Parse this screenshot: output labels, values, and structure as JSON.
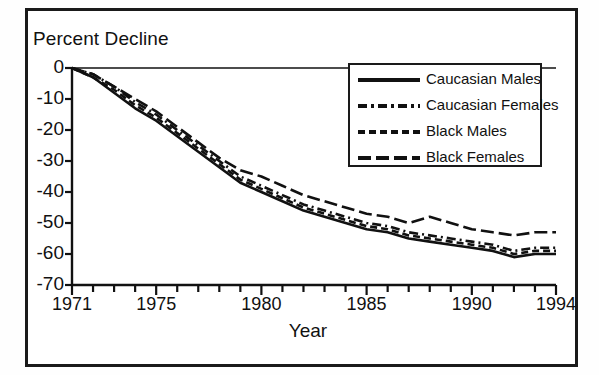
{
  "figure": {
    "y_axis_title": "Percent Decline",
    "x_axis_title": "Year"
  },
  "chart_data": {
    "type": "line",
    "title": "",
    "xlabel": "Year",
    "ylabel": "Percent Decline",
    "xlim": [
      1971,
      1994
    ],
    "ylim": [
      -70,
      0
    ],
    "grid": false,
    "legend_position": "top-right",
    "x_tick_labels": [
      "1971",
      "1975",
      "1980",
      "1985",
      "1990",
      "1994"
    ],
    "x_tick_values": [
      1971,
      1975,
      1980,
      1985,
      1990,
      1994
    ],
    "y_tick_labels": [
      "0",
      "-10",
      "-20",
      "-30",
      "-40",
      "-50",
      "-60",
      "-70"
    ],
    "y_tick_values": [
      0,
      -10,
      -20,
      -30,
      -40,
      -50,
      -60,
      -70
    ],
    "x": [
      1971,
      1972,
      1973,
      1974,
      1975,
      1976,
      1977,
      1978,
      1979,
      1980,
      1981,
      1982,
      1983,
      1984,
      1985,
      1986,
      1987,
      1988,
      1989,
      1990,
      1991,
      1992,
      1993,
      1994
    ],
    "series": [
      {
        "name": "Caucasian Males",
        "style": "solid",
        "color": "#111111",
        "values": [
          0,
          -3,
          -8,
          -13,
          -17,
          -22,
          -27,
          -32,
          -37,
          -40,
          -43,
          -46,
          -48,
          -50,
          -52,
          -53,
          -55,
          -56,
          -57,
          -58,
          -59,
          -61,
          -60,
          -60
        ]
      },
      {
        "name": "Caucasian Females",
        "style": "dash-dot",
        "color": "#111111",
        "values": [
          0,
          -2,
          -6,
          -11,
          -15,
          -20,
          -25,
          -30,
          -35,
          -38,
          -41,
          -44,
          -46,
          -48,
          -50,
          -51,
          -53,
          -54,
          -55,
          -56,
          -57,
          -59,
          -58,
          -58
        ]
      },
      {
        "name": "Black Males",
        "style": "dashed-short",
        "color": "#111111",
        "values": [
          0,
          -3,
          -7,
          -12,
          -16,
          -21,
          -26,
          -31,
          -36,
          -39,
          -42,
          -45,
          -47,
          -49,
          -51,
          -52,
          -54,
          -55,
          -56,
          -57,
          -58,
          -60,
          -59,
          -59
        ]
      },
      {
        "name": "Black Females",
        "style": "dashed-long",
        "color": "#111111",
        "values": [
          0,
          -2,
          -6,
          -10,
          -14,
          -19,
          -24,
          -29,
          -33,
          -35,
          -38,
          -41,
          -43,
          -45,
          -47,
          -48,
          -50,
          -48,
          -50,
          -52,
          -53,
          -54,
          -53,
          -53
        ]
      }
    ]
  },
  "legend": {
    "items": [
      {
        "label": "Caucasian Males"
      },
      {
        "label": "Caucasian Females"
      },
      {
        "label": "Black Males"
      },
      {
        "label": "Black Females"
      }
    ]
  }
}
